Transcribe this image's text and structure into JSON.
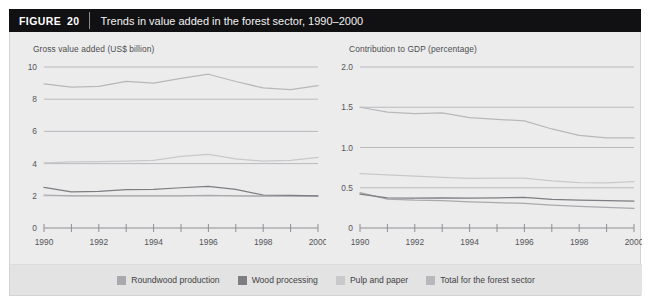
{
  "figure": {
    "tag_label": "FIGURE",
    "tag_number": "20",
    "title": "Trends in value added in the forest sector, 1990–2000"
  },
  "legend": {
    "items": [
      {
        "label": "Roundwood production",
        "color": "#a9a9ad"
      },
      {
        "label": "Wood processing",
        "color": "#7d7d82"
      },
      {
        "label": "Pulp and paper",
        "color": "#c9c9cc"
      },
      {
        "label": "Total for the forest sector",
        "color": "#b8b8bc"
      }
    ]
  },
  "style": {
    "panel_bg": "#ececed",
    "legend_bg": "#e3e3e4",
    "gridline": "#b4b4b8",
    "axis": "#8f8f93",
    "tick_text": "#55555a"
  },
  "chart_data": [
    {
      "id": "gross-value-added",
      "type": "line",
      "title": "Gross value added (US$ billion)",
      "xlabel": "",
      "ylabel": "Gross value added (US$ billion)",
      "x": [
        1990,
        1991,
        1992,
        1993,
        1994,
        1995,
        1996,
        1997,
        1998,
        1999,
        2000
      ],
      "xlim": [
        1990,
        2000
      ],
      "xticks": [
        1990,
        1991,
        1992,
        1993,
        1994,
        1995,
        1996,
        1997,
        1998,
        1999,
        2000
      ],
      "xticklabels": [
        "1990",
        "",
        "1992",
        "",
        "1994",
        "",
        "1996",
        "",
        "1998",
        "",
        "2000"
      ],
      "ylim": [
        0,
        10
      ],
      "yticks": [
        0,
        2,
        4,
        6,
        8,
        10
      ],
      "yticklabels": [
        "0",
        "2",
        "4",
        "6",
        "8",
        "10"
      ],
      "grid": "horizontal",
      "legend_position": "bottom",
      "series": [
        {
          "name": "Roundwood production",
          "color": "#a9a9ad",
          "values": [
            2.05,
            2.0,
            2.0,
            2.0,
            2.0,
            2.0,
            2.02,
            2.0,
            1.98,
            1.98,
            1.98
          ]
        },
        {
          "name": "Wood processing",
          "color": "#7d7d82",
          "values": [
            2.52,
            2.25,
            2.28,
            2.38,
            2.4,
            2.5,
            2.58,
            2.4,
            2.05,
            2.02,
            2.0
          ]
        },
        {
          "name": "Pulp and paper",
          "color": "#c9c9cc",
          "values": [
            4.05,
            4.1,
            4.12,
            4.15,
            4.2,
            4.45,
            4.58,
            4.3,
            4.15,
            4.2,
            4.38
          ]
        },
        {
          "name": "Total for the forest sector",
          "color": "#b8b8bc",
          "values": [
            8.95,
            8.75,
            8.8,
            9.1,
            9.0,
            9.3,
            9.55,
            9.1,
            8.7,
            8.6,
            8.85
          ]
        }
      ]
    },
    {
      "id": "contribution-to-gdp",
      "type": "line",
      "title": "Contribution to GDP (percentage)",
      "xlabel": "",
      "ylabel": "Contribution to GDP (percentage)",
      "x": [
        1990,
        1991,
        1992,
        1993,
        1994,
        1995,
        1996,
        1997,
        1998,
        1999,
        2000
      ],
      "xlim": [
        1990,
        2000
      ],
      "xticks": [
        1990,
        1991,
        1992,
        1993,
        1994,
        1995,
        1996,
        1997,
        1998,
        1999,
        2000
      ],
      "xticklabels": [
        "1990",
        "",
        "1992",
        "",
        "1994",
        "",
        "1996",
        "",
        "1998",
        "",
        "2000"
      ],
      "ylim": [
        0,
        2.0
      ],
      "yticks": [
        0,
        0.5,
        1.0,
        1.5,
        2.0
      ],
      "yticklabels": [
        "0",
        "0.5",
        "1.0",
        "1.5",
        "2.0"
      ],
      "grid": "horizontal",
      "legend_position": "bottom",
      "series": [
        {
          "name": "Roundwood production",
          "color": "#a9a9ad",
          "values": [
            0.44,
            0.36,
            0.345,
            0.34,
            0.325,
            0.315,
            0.305,
            0.285,
            0.27,
            0.255,
            0.245
          ]
        },
        {
          "name": "Wood processing",
          "color": "#7d7d82",
          "values": [
            0.42,
            0.375,
            0.37,
            0.375,
            0.37,
            0.375,
            0.38,
            0.355,
            0.345,
            0.34,
            0.335
          ]
        },
        {
          "name": "Pulp and paper",
          "color": "#c9c9cc",
          "values": [
            0.675,
            0.66,
            0.645,
            0.63,
            0.615,
            0.62,
            0.62,
            0.585,
            0.565,
            0.56,
            0.575
          ]
        },
        {
          "name": "Total for the forest sector",
          "color": "#b8b8bc",
          "values": [
            1.5,
            1.44,
            1.42,
            1.43,
            1.37,
            1.35,
            1.33,
            1.23,
            1.15,
            1.12,
            1.12
          ]
        }
      ]
    }
  ]
}
